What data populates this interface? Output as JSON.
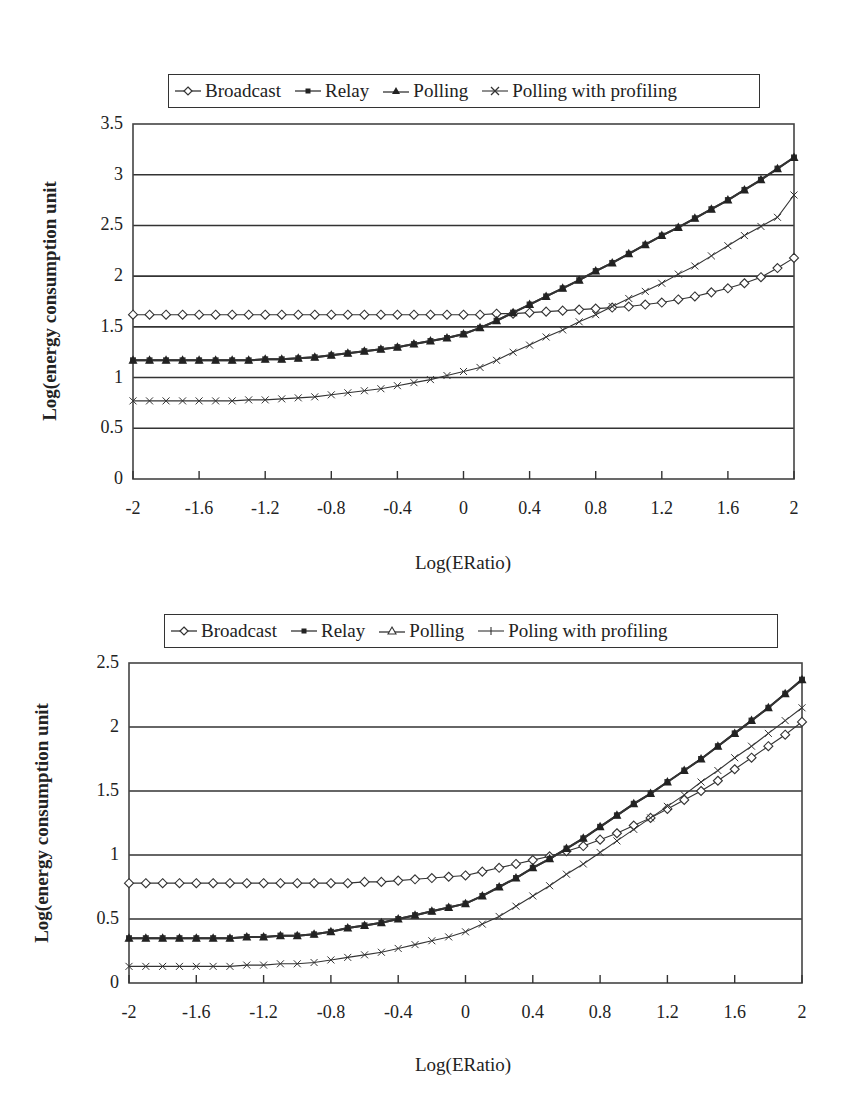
{
  "chart_data": [
    {
      "type": "line",
      "title": "",
      "xlabel": "Log(ERatio)",
      "ylabel": "Log(energy consumption unit",
      "xlim": [
        -2,
        2
      ],
      "ylim": [
        0,
        3.5
      ],
      "xticks": [
        "-2",
        "-1.6",
        "-1.2",
        "-0.8",
        "-0.4",
        "0",
        "0.4",
        "0.8",
        "1.2",
        "1.6",
        "2"
      ],
      "yticks": [
        "0",
        "0.5",
        "1",
        "1.5",
        "2",
        "2.5",
        "3",
        "3.5"
      ],
      "grid": "horizontal",
      "legend_position": "top",
      "legend": [
        "Broadcast",
        "Relay",
        "Polling",
        "Polling with profiling"
      ],
      "x": [
        -2,
        -1.9,
        -1.8,
        -1.7,
        -1.6,
        -1.5,
        -1.4,
        -1.3,
        -1.2,
        -1.1,
        -1,
        -0.9,
        -0.8,
        -0.7,
        -0.6,
        -0.5,
        -0.4,
        -0.3,
        -0.2,
        -0.1,
        0,
        0.1,
        0.2,
        0.3,
        0.4,
        0.5,
        0.6,
        0.7,
        0.8,
        0.9,
        1,
        1.1,
        1.2,
        1.3,
        1.4,
        1.5,
        1.6,
        1.7,
        1.8,
        1.9,
        2
      ],
      "series": [
        {
          "name": "Broadcast",
          "marker": "diamond-open",
          "values": [
            1.62,
            1.62,
            1.62,
            1.62,
            1.62,
            1.62,
            1.62,
            1.62,
            1.62,
            1.62,
            1.62,
            1.62,
            1.62,
            1.62,
            1.62,
            1.62,
            1.62,
            1.62,
            1.62,
            1.62,
            1.62,
            1.62,
            1.63,
            1.63,
            1.64,
            1.65,
            1.66,
            1.67,
            1.68,
            1.69,
            1.7,
            1.72,
            1.74,
            1.77,
            1.8,
            1.84,
            1.88,
            1.93,
            1.99,
            2.08,
            2.18
          ]
        },
        {
          "name": "Relay",
          "marker": "square-filled",
          "values": [
            1.17,
            1.17,
            1.17,
            1.17,
            1.17,
            1.17,
            1.17,
            1.17,
            1.18,
            1.18,
            1.19,
            1.2,
            1.22,
            1.24,
            1.26,
            1.28,
            1.3,
            1.33,
            1.36,
            1.39,
            1.43,
            1.49,
            1.56,
            1.64,
            1.72,
            1.8,
            1.88,
            1.96,
            2.05,
            2.13,
            2.22,
            2.31,
            2.4,
            2.48,
            2.57,
            2.66,
            2.75,
            2.85,
            2.95,
            3.06,
            3.17
          ]
        },
        {
          "name": "Polling",
          "marker": "triangle-filled",
          "values": [
            1.17,
            1.17,
            1.17,
            1.17,
            1.17,
            1.17,
            1.17,
            1.17,
            1.18,
            1.18,
            1.19,
            1.2,
            1.22,
            1.24,
            1.26,
            1.28,
            1.3,
            1.33,
            1.36,
            1.39,
            1.43,
            1.49,
            1.56,
            1.64,
            1.72,
            1.8,
            1.88,
            1.96,
            2.05,
            2.13,
            2.22,
            2.31,
            2.4,
            2.48,
            2.57,
            2.66,
            2.75,
            2.85,
            2.95,
            3.06,
            3.17
          ]
        },
        {
          "name": "Polling with profiling",
          "marker": "x",
          "values": [
            0.77,
            0.77,
            0.77,
            0.77,
            0.77,
            0.77,
            0.77,
            0.78,
            0.78,
            0.79,
            0.8,
            0.81,
            0.83,
            0.85,
            0.87,
            0.89,
            0.92,
            0.95,
            0.98,
            1.02,
            1.06,
            1.1,
            1.17,
            1.25,
            1.32,
            1.4,
            1.47,
            1.55,
            1.62,
            1.7,
            1.78,
            1.85,
            1.93,
            2.02,
            2.1,
            2.2,
            2.3,
            2.4,
            2.49,
            2.58,
            2.8
          ]
        }
      ]
    },
    {
      "type": "line",
      "title": "",
      "xlabel": "Log(ERatio)",
      "ylabel": "Log(energy consumption unit",
      "xlim": [
        -2,
        2
      ],
      "ylim": [
        0,
        2.5
      ],
      "xticks": [
        "-2",
        "-1.6",
        "-1.2",
        "-0.8",
        "-0.4",
        "0",
        "0.4",
        "0.8",
        "1.2",
        "1.6",
        "2"
      ],
      "yticks": [
        "0",
        "0.5",
        "1",
        "1.5",
        "2",
        "2.5"
      ],
      "grid": "horizontal",
      "legend_position": "top",
      "legend": [
        "Broadcast",
        "Relay",
        "Polling",
        "Poling with profiling"
      ],
      "x": [
        -2,
        -1.9,
        -1.8,
        -1.7,
        -1.6,
        -1.5,
        -1.4,
        -1.3,
        -1.2,
        -1.1,
        -1,
        -0.9,
        -0.8,
        -0.7,
        -0.6,
        -0.5,
        -0.4,
        -0.3,
        -0.2,
        -0.1,
        0,
        0.1,
        0.2,
        0.3,
        0.4,
        0.5,
        0.6,
        0.7,
        0.8,
        0.9,
        1,
        1.1,
        1.2,
        1.3,
        1.4,
        1.5,
        1.6,
        1.7,
        1.8,
        1.9,
        2
      ],
      "series": [
        {
          "name": "Broadcast",
          "marker": "diamond-open",
          "values": [
            0.78,
            0.78,
            0.78,
            0.78,
            0.78,
            0.78,
            0.78,
            0.78,
            0.78,
            0.78,
            0.78,
            0.78,
            0.78,
            0.78,
            0.79,
            0.79,
            0.8,
            0.81,
            0.82,
            0.83,
            0.84,
            0.87,
            0.9,
            0.93,
            0.96,
            0.99,
            1.03,
            1.07,
            1.12,
            1.17,
            1.23,
            1.29,
            1.36,
            1.43,
            1.5,
            1.58,
            1.67,
            1.76,
            1.85,
            1.94,
            2.04
          ]
        },
        {
          "name": "Relay",
          "marker": "square-filled",
          "values": [
            0.35,
            0.35,
            0.35,
            0.35,
            0.35,
            0.35,
            0.35,
            0.36,
            0.36,
            0.37,
            0.37,
            0.38,
            0.4,
            0.43,
            0.45,
            0.47,
            0.5,
            0.53,
            0.56,
            0.59,
            0.62,
            0.68,
            0.75,
            0.82,
            0.9,
            0.97,
            1.05,
            1.13,
            1.22,
            1.31,
            1.4,
            1.48,
            1.57,
            1.66,
            1.75,
            1.85,
            1.95,
            2.05,
            2.15,
            2.26,
            2.37
          ]
        },
        {
          "name": "Polling",
          "marker": "triangle-filled",
          "values": [
            0.35,
            0.35,
            0.35,
            0.35,
            0.35,
            0.35,
            0.35,
            0.36,
            0.36,
            0.37,
            0.37,
            0.38,
            0.4,
            0.43,
            0.45,
            0.47,
            0.5,
            0.53,
            0.56,
            0.59,
            0.62,
            0.68,
            0.75,
            0.82,
            0.9,
            0.97,
            1.05,
            1.13,
            1.22,
            1.31,
            1.4,
            1.48,
            1.57,
            1.66,
            1.75,
            1.85,
            1.95,
            2.05,
            2.15,
            2.26,
            2.37
          ]
        },
        {
          "name": "Poling with profiling",
          "marker": "x",
          "values": [
            0.13,
            0.13,
            0.13,
            0.13,
            0.13,
            0.13,
            0.13,
            0.14,
            0.14,
            0.15,
            0.15,
            0.16,
            0.18,
            0.2,
            0.22,
            0.24,
            0.27,
            0.3,
            0.33,
            0.36,
            0.4,
            0.46,
            0.52,
            0.6,
            0.68,
            0.76,
            0.85,
            0.93,
            1.02,
            1.11,
            1.2,
            1.29,
            1.38,
            1.47,
            1.57,
            1.66,
            1.76,
            1.85,
            1.95,
            2.05,
            2.15
          ]
        }
      ]
    }
  ],
  "charts": [
    {
      "legend": {
        "items": [
          "Broadcast",
          "Relay",
          "Polling",
          "Polling with profiling"
        ]
      },
      "ylabel": "Log(energy consumption unit",
      "xlabel": "Log(ERatio)"
    },
    {
      "legend": {
        "items": [
          "Broadcast",
          "Relay",
          "Polling",
          "Poling with profiling"
        ]
      },
      "ylabel": "Log(energy consumption unit",
      "xlabel": "Log(ERatio)"
    }
  ]
}
